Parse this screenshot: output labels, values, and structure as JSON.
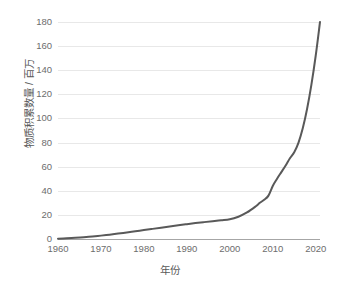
{
  "chart_data": {
    "type": "line",
    "title": "",
    "subtitle": "",
    "xlabel": "年份",
    "ylabel": "物质积累数量 / 百万",
    "xlim": [
      1960,
      2021
    ],
    "ylim": [
      0,
      180
    ],
    "grid": "horizontal",
    "legend": "none",
    "xticks": [
      "1960",
      "1970",
      "1980",
      "1990",
      "2000",
      "2010",
      "2020"
    ],
    "xtick_values": [
      1960,
      1970,
      1980,
      1990,
      2000,
      2010,
      2020
    ],
    "yticks": [
      "0",
      "20",
      "40",
      "60",
      "80",
      "100",
      "120",
      "140",
      "160",
      "180"
    ],
    "ytick_values": [
      0,
      20,
      40,
      60,
      80,
      100,
      120,
      140,
      160,
      180
    ],
    "series": [
      {
        "name": "物质积累数量",
        "color": "#595959",
        "line_width": 2,
        "x": [
          1960,
          1962,
          1964,
          1966,
          1968,
          1970,
          1972,
          1974,
          1976,
          1978,
          1980,
          1982,
          1984,
          1986,
          1988,
          1990,
          1992,
          1994,
          1996,
          1998,
          2000,
          2002,
          2004,
          2006,
          2007,
          2008,
          2009,
          2010,
          2011,
          2012,
          2013,
          2014,
          2015,
          2016,
          2017,
          2018,
          2019,
          2020,
          2021
        ],
        "values": [
          0.3,
          0.6,
          1.0,
          1.5,
          2.1,
          2.8,
          3.6,
          4.5,
          5.4,
          6.4,
          7.4,
          8.4,
          9.4,
          10.4,
          11.4,
          12.3,
          13.2,
          14.0,
          14.8,
          15.5,
          16.3,
          18.5,
          22.0,
          27.0,
          30.0,
          32.5,
          36.0,
          44.0,
          50.0,
          55.5,
          61.0,
          67.0,
          72.0,
          80.0,
          92.0,
          108.0,
          128.0,
          152.0,
          180.0
        ]
      }
    ],
    "annotations": []
  },
  "colors": {
    "background": "#ffffff",
    "gridline": "#e8e8e8",
    "axis_line": "#a6a6a6",
    "tick_text": "#6d6d6d",
    "axis_title_text": "#595959",
    "series_line": "#595959"
  }
}
